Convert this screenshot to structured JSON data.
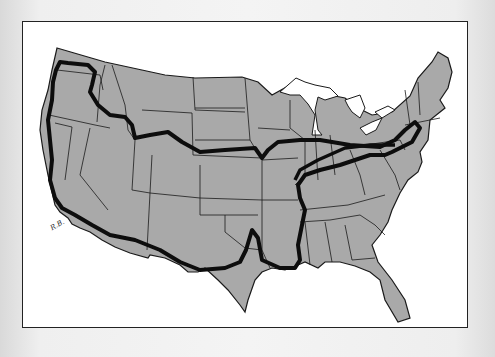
{
  "map": {
    "subject": "Contiguous United States outline with state borders",
    "route_description": "Thick black hand-drawn road-trip route looping across the country",
    "signature": "R.B.",
    "colors": {
      "land": "#a9a9a9",
      "state_border": "#1a1a1a",
      "route": "#0d0d0d",
      "paper": "#ffffff",
      "water": "#ffffff"
    }
  }
}
